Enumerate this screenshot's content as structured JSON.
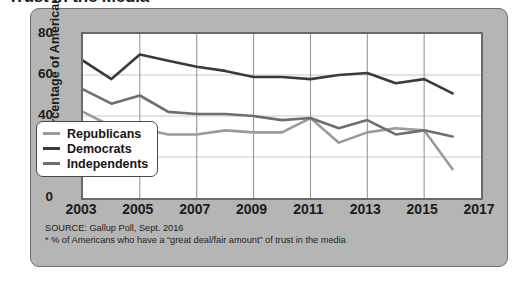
{
  "figure": {
    "title": "Trust in the Media"
  },
  "axes": {
    "y_title": "Percentage of Americans",
    "y_ticks": [
      "0",
      "20",
      "40",
      "60",
      "80"
    ],
    "x_ticks": [
      "2003",
      "2005",
      "2007",
      "2009",
      "2011",
      "2013",
      "2015",
      "2017"
    ]
  },
  "legend": {
    "items": [
      {
        "label": "Republicans",
        "color": "#9a9a9a"
      },
      {
        "label": "Democrats",
        "color": "#3a3a3a"
      },
      {
        "label": "Independents",
        "color": "#6e6e6e"
      }
    ]
  },
  "footnote": {
    "source": "SOURCE: Gallup Poll, Sept. 2016",
    "note": "* % of Americans who have a “great deal/fair amount” of trust in the media"
  },
  "chart_data": {
    "type": "line",
    "title": "Trust in the Media",
    "xlabel": "",
    "ylabel": "Percentage of Americans",
    "xlim": [
      2003,
      2017
    ],
    "ylim": [
      0,
      80
    ],
    "ytick_step": 20,
    "xtick_step": 2,
    "grid": true,
    "legend_position": "inside-lower-left",
    "x": [
      2003,
      2004,
      2005,
      2006,
      2007,
      2008,
      2009,
      2010,
      2011,
      2012,
      2013,
      2014,
      2015,
      2016
    ],
    "series": [
      {
        "name": "Republicans",
        "color": "#9a9a9a",
        "values": [
          42,
          35,
          34,
          31,
          31,
          33,
          32,
          32,
          39,
          27,
          32,
          34,
          33,
          14
        ]
      },
      {
        "name": "Democrats",
        "color": "#3a3a3a",
        "values": [
          67,
          58,
          70,
          67,
          64,
          62,
          59,
          59,
          58,
          60,
          61,
          56,
          58,
          51
        ]
      },
      {
        "name": "Independents",
        "color": "#6e6e6e",
        "values": [
          53,
          46,
          50,
          42,
          41,
          41,
          40,
          38,
          39,
          34,
          38,
          31,
          33,
          30
        ]
      }
    ]
  }
}
